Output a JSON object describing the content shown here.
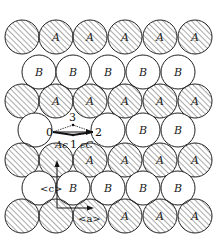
{
  "figure": {
    "type": "close-packed atomic layer diagram",
    "circle_radius": 17,
    "hatched_type": "A",
    "open_type": "B",
    "colors": {
      "stroke": "#222222",
      "hatch": "#444444",
      "background": "#ffffff"
    }
  },
  "rows": [
    {
      "kind": "A",
      "y": 37,
      "x": [
        22,
        56,
        90,
        125,
        160,
        195
      ],
      "labels": [
        "",
        "A",
        "A",
        "A",
        "A",
        "A"
      ]
    },
    {
      "kind": "B",
      "y": 72,
      "x": [
        39,
        73,
        108,
        143,
        178
      ],
      "labels": [
        "B",
        "B",
        "B",
        "B",
        "B"
      ]
    },
    {
      "kind": "A",
      "y": 101,
      "x": [
        22,
        56,
        90,
        125,
        160,
        195
      ],
      "labels": [
        "",
        "A",
        "A",
        "A",
        "A",
        "A"
      ]
    },
    {
      "kind": "B",
      "y": 130,
      "x": [
        35,
        108,
        143,
        178
      ],
      "labels": [
        "",
        "",
        "B",
        "B"
      ]
    },
    {
      "kind": "A",
      "y": 160,
      "x": [
        22,
        56,
        90,
        125,
        160,
        195
      ],
      "labels": [
        "",
        "",
        "A",
        "A",
        "A",
        "A"
      ]
    },
    {
      "kind": "B",
      "y": 188,
      "x": [
        39,
        73,
        108,
        143,
        178
      ],
      "labels": [
        "",
        "B",
        "B",
        "B",
        "B"
      ]
    },
    {
      "kind": "A",
      "y": 216,
      "x": [
        22,
        56,
        90,
        125,
        160,
        195
      ],
      "labels": [
        "",
        "",
        "",
        "A",
        "A",
        "A"
      ]
    }
  ],
  "annotations": {
    "site_0": "0",
    "site_1": "1",
    "site_2": "2",
    "site_3": "3",
    "label_A_eps": "Aϵ",
    "label_eps_C": "ϵC",
    "axis_c": "<c>",
    "axis_a": "<a>"
  }
}
